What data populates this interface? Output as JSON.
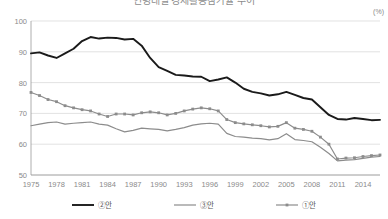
{
  "chart_data": {
    "type": "line",
    "title": "연령대별 경제활동참가율 추이",
    "unit_label": "(%)",
    "xlabel": "",
    "ylabel": "",
    "ylim": [
      50,
      100
    ],
    "yticks": [
      50,
      60,
      70,
      80,
      90,
      100
    ],
    "xlim": [
      1975,
      2016
    ],
    "xticks": [
      1975,
      1978,
      1981,
      1984,
      1987,
      1990,
      1993,
      1996,
      1999,
      2002,
      2005,
      2008,
      2011,
      2014
    ],
    "grid": true,
    "legend_position": "bottom",
    "x": [
      1975,
      1976,
      1977,
      1978,
      1979,
      1980,
      1981,
      1982,
      1983,
      1984,
      1985,
      1986,
      1987,
      1988,
      1989,
      1990,
      1991,
      1992,
      1993,
      1994,
      1995,
      1996,
      1997,
      1998,
      1999,
      2000,
      2001,
      2002,
      2003,
      2004,
      2005,
      2006,
      2007,
      2008,
      2009,
      2010,
      2011,
      2012,
      2013,
      2014,
      2015,
      2016
    ],
    "series": [
      {
        "name": "②안",
        "color": "#1a1a1a",
        "width": 1.9,
        "marker": "none",
        "values": [
          89.5,
          89.8,
          88.8,
          88.0,
          89.5,
          91.0,
          93.5,
          94.8,
          94.3,
          94.6,
          94.5,
          94.0,
          94.2,
          92.0,
          88.0,
          85.0,
          83.8,
          82.5,
          82.3,
          82.0,
          81.9,
          80.5,
          81.0,
          81.7,
          80.0,
          78.0,
          77.0,
          76.5,
          75.8,
          76.2,
          77.0,
          76.0,
          75.0,
          74.5,
          72.0,
          69.5,
          68.2,
          68.0,
          68.5,
          68.2,
          67.8,
          67.9
        ]
      },
      {
        "name": "③안",
        "color": "#8c8c8c",
        "width": 1.2,
        "marker": "none",
        "values": [
          66.0,
          66.5,
          67.0,
          67.2,
          66.5,
          66.8,
          67.0,
          67.2,
          66.5,
          66.2,
          65.0,
          64.0,
          64.5,
          65.2,
          65.0,
          64.8,
          64.3,
          64.8,
          65.4,
          66.2,
          66.6,
          66.8,
          66.5,
          63.5,
          62.5,
          62.3,
          62.0,
          61.8,
          61.4,
          61.8,
          63.4,
          61.5,
          61.2,
          60.8,
          59.0,
          57.0,
          54.6,
          54.8,
          55.0,
          55.4,
          55.8,
          56.0
        ]
      },
      {
        "name": "①안",
        "color": "#8c8c8c",
        "width": 1.2,
        "marker": "square",
        "values": [
          76.8,
          75.8,
          74.5,
          73.8,
          72.5,
          71.8,
          71.2,
          70.8,
          69.8,
          69.0,
          69.8,
          69.8,
          69.5,
          70.2,
          70.5,
          70.2,
          69.5,
          70.0,
          70.8,
          71.4,
          71.8,
          71.5,
          70.8,
          68.0,
          67.0,
          66.6,
          66.3,
          66.0,
          65.6,
          65.8,
          67.0,
          65.2,
          64.8,
          64.2,
          62.3,
          60.0,
          55.2,
          55.5,
          55.6,
          56.0,
          56.3,
          56.5
        ]
      }
    ]
  }
}
